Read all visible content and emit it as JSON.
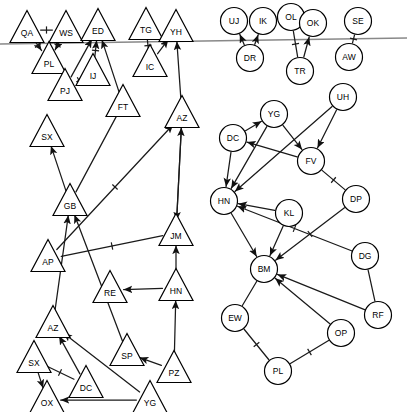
{
  "diagram": {
    "colors": {
      "node_stroke": "#000000",
      "node_fill": "#ffffff",
      "edge": "#1a1a1a",
      "divider": "#888888",
      "background": "#ffffff"
    },
    "divider_line": {
      "name": "horizontal-divider",
      "x1": 0,
      "y1": 44,
      "x2": 407,
      "y2": 38
    },
    "nodes": [
      {
        "id": "QA",
        "label": "QA",
        "shape": "triangle",
        "x": 27,
        "y": 27
      },
      {
        "id": "WS",
        "label": "WS",
        "shape": "triangle",
        "x": 66,
        "y": 27
      },
      {
        "id": "ED",
        "label": "ED",
        "shape": "triangle",
        "x": 98,
        "y": 25
      },
      {
        "id": "TG",
        "label": "TG",
        "shape": "triangle",
        "x": 146,
        "y": 24
      },
      {
        "id": "YH",
        "label": "YH",
        "shape": "triangle",
        "x": 176,
        "y": 26
      },
      {
        "id": "PL1",
        "label": "PL",
        "shape": "triangle",
        "x": 49,
        "y": 58
      },
      {
        "id": "IC",
        "label": "IC",
        "shape": "triangle",
        "x": 150,
        "y": 61
      },
      {
        "id": "IJ",
        "label": "IJ",
        "shape": "triangle",
        "x": 93,
        "y": 70
      },
      {
        "id": "PJ",
        "label": "PJ",
        "shape": "triangle",
        "x": 65,
        "y": 85
      },
      {
        "id": "FT",
        "label": "FT",
        "shape": "triangle",
        "x": 123,
        "y": 101
      },
      {
        "id": "AZ1",
        "label": "AZ",
        "shape": "triangle",
        "x": 182,
        "y": 112
      },
      {
        "id": "SX1",
        "label": "SX",
        "shape": "triangle",
        "x": 47,
        "y": 131
      },
      {
        "id": "GB",
        "label": "GB",
        "shape": "triangle",
        "x": 70,
        "y": 200
      },
      {
        "id": "JM",
        "label": "JM",
        "shape": "triangle",
        "x": 176,
        "y": 230
      },
      {
        "id": "AP",
        "label": "AP",
        "shape": "triangle",
        "x": 48,
        "y": 256
      },
      {
        "id": "RE",
        "label": "RE",
        "shape": "triangle",
        "x": 110,
        "y": 287
      },
      {
        "id": "HN1",
        "label": "HN",
        "shape": "triangle",
        "x": 176,
        "y": 285
      },
      {
        "id": "AZ2",
        "label": "AZ",
        "shape": "triangle",
        "x": 53,
        "y": 322
      },
      {
        "id": "SP",
        "label": "SP",
        "shape": "triangle",
        "x": 127,
        "y": 350
      },
      {
        "id": "SX2",
        "label": "SX",
        "shape": "triangle",
        "x": 34,
        "y": 357
      },
      {
        "id": "PZ",
        "label": "PZ",
        "shape": "triangle",
        "x": 174,
        "y": 367
      },
      {
        "id": "DC2",
        "label": "DC",
        "shape": "triangle",
        "x": 86,
        "y": 382
      },
      {
        "id": "OX",
        "label": "OX",
        "shape": "triangle",
        "x": 47,
        "y": 397
      },
      {
        "id": "YG2",
        "label": "YG",
        "shape": "triangle",
        "x": 150,
        "y": 397
      },
      {
        "id": "UJ",
        "label": "UJ",
        "shape": "circle",
        "x": 234,
        "y": 21
      },
      {
        "id": "IK",
        "label": "IK",
        "shape": "circle",
        "x": 263,
        "y": 21
      },
      {
        "id": "OL",
        "label": "OL",
        "shape": "circle",
        "x": 291,
        "y": 17
      },
      {
        "id": "OK",
        "label": "OK",
        "shape": "circle",
        "x": 313,
        "y": 23
      },
      {
        "id": "SE",
        "label": "SE",
        "shape": "circle",
        "x": 358,
        "y": 21
      },
      {
        "id": "DR",
        "label": "DR",
        "shape": "circle",
        "x": 250,
        "y": 58
      },
      {
        "id": "AW",
        "label": "AW",
        "shape": "circle",
        "x": 349,
        "y": 57
      },
      {
        "id": "TR",
        "label": "TR",
        "shape": "circle",
        "x": 300,
        "y": 71
      },
      {
        "id": "UH",
        "label": "UH",
        "shape": "circle",
        "x": 343,
        "y": 97
      },
      {
        "id": "YG1",
        "label": "YG",
        "shape": "circle",
        "x": 274,
        "y": 114
      },
      {
        "id": "DC1",
        "label": "DC",
        "shape": "circle",
        "x": 233,
        "y": 138
      },
      {
        "id": "FV",
        "label": "FV",
        "shape": "circle",
        "x": 311,
        "y": 161
      },
      {
        "id": "HN2",
        "label": "HN",
        "shape": "circle",
        "x": 224,
        "y": 201
      },
      {
        "id": "KL",
        "label": "KL",
        "shape": "circle",
        "x": 289,
        "y": 213
      },
      {
        "id": "DP",
        "label": "DP",
        "shape": "circle",
        "x": 356,
        "y": 199
      },
      {
        "id": "DG",
        "label": "DG",
        "shape": "circle",
        "x": 365,
        "y": 256
      },
      {
        "id": "BM",
        "label": "BM",
        "shape": "circle",
        "x": 264,
        "y": 269
      },
      {
        "id": "EW",
        "label": "EW",
        "shape": "circle",
        "x": 235,
        "y": 318
      },
      {
        "id": "RF",
        "label": "RF",
        "shape": "circle",
        "x": 378,
        "y": 315
      },
      {
        "id": "OP",
        "label": "OP",
        "shape": "circle",
        "x": 341,
        "y": 333
      },
      {
        "id": "PL2",
        "label": "PL",
        "shape": "circle",
        "x": 278,
        "y": 371
      }
    ],
    "edges": [
      {
        "from": "QA",
        "to": "WS",
        "arrow": false,
        "tick": true
      },
      {
        "from": "QA",
        "to": "PL1",
        "arrow": true,
        "tick": true
      },
      {
        "from": "WS",
        "to": "PL1",
        "arrow": true,
        "tick": true
      },
      {
        "from": "PJ",
        "to": "ED",
        "arrow": true,
        "tick": false
      },
      {
        "from": "IJ",
        "to": "ED",
        "arrow": true,
        "tick": true
      },
      {
        "from": "IJ",
        "to": "PJ",
        "arrow": true,
        "tick": true
      },
      {
        "from": "FT",
        "to": "ED",
        "arrow": true,
        "tick": false
      },
      {
        "from": "TG",
        "to": "IC",
        "arrow": false,
        "tick": true
      },
      {
        "from": "IC",
        "to": "YH",
        "arrow": true,
        "tick": false
      },
      {
        "from": "AZ1",
        "to": "YH",
        "arrow": true,
        "tick": false
      },
      {
        "from": "GB",
        "to": "SX1",
        "arrow": true,
        "tick": false
      },
      {
        "from": "GB",
        "to": "FT",
        "arrow": false,
        "tick": false
      },
      {
        "from": "AZ1",
        "to": "JM",
        "arrow": true,
        "tick": false
      },
      {
        "from": "JM",
        "to": "AZ1",
        "arrow": true,
        "tick": false
      },
      {
        "from": "AP",
        "to": "AZ1",
        "arrow": true,
        "tick": true
      },
      {
        "from": "AZ2",
        "to": "GB",
        "arrow": true,
        "tick": false
      },
      {
        "from": "AP",
        "to": "JM",
        "arrow": false,
        "tick": true
      },
      {
        "from": "SP",
        "to": "GB",
        "arrow": true,
        "tick": false
      },
      {
        "from": "HN1",
        "to": "RE",
        "arrow": true,
        "tick": false
      },
      {
        "from": "HN1",
        "to": "JM",
        "arrow": true,
        "tick": false
      },
      {
        "from": "PZ",
        "to": "HN1",
        "arrow": true,
        "tick": false
      },
      {
        "from": "YG2",
        "to": "OX",
        "arrow": true,
        "tick": false
      },
      {
        "from": "YG2",
        "to": "AZ2",
        "arrow": true,
        "tick": false
      },
      {
        "from": "DC2",
        "to": "AZ2",
        "arrow": true,
        "tick": false
      },
      {
        "from": "SX2",
        "to": "OX",
        "arrow": true,
        "tick": false
      },
      {
        "from": "SX2",
        "to": "DC2",
        "arrow": false,
        "tick": true
      },
      {
        "from": "PZ",
        "to": "SP",
        "arrow": true,
        "tick": false
      },
      {
        "from": "DR",
        "to": "UJ",
        "arrow": true,
        "tick": false
      },
      {
        "from": "DR",
        "to": "IK",
        "arrow": true,
        "tick": false
      },
      {
        "from": "OL",
        "to": "TR",
        "arrow": false,
        "tick": true
      },
      {
        "from": "TR",
        "to": "OK",
        "arrow": true,
        "tick": false
      },
      {
        "from": "AW",
        "to": "SE",
        "arrow": false,
        "tick": true
      },
      {
        "from": "DC1",
        "to": "YG1",
        "arrow": true,
        "tick": false
      },
      {
        "from": "DC1",
        "to": "HN2",
        "arrow": true,
        "tick": false
      },
      {
        "from": "YG1",
        "to": "HN2",
        "arrow": true,
        "tick": false
      },
      {
        "from": "YG1",
        "to": "FV",
        "arrow": true,
        "tick": false
      },
      {
        "from": "UH",
        "to": "FV",
        "arrow": true,
        "tick": false
      },
      {
        "from": "UH",
        "to": "HN2",
        "arrow": true,
        "tick": false
      },
      {
        "from": "FV",
        "to": "DC1",
        "arrow": true,
        "tick": false
      },
      {
        "from": "FV",
        "to": "DP",
        "arrow": false,
        "tick": true
      },
      {
        "from": "HN2",
        "to": "BM",
        "arrow": true,
        "tick": false
      },
      {
        "from": "KL",
        "to": "HN2",
        "arrow": true,
        "tick": false
      },
      {
        "from": "KL",
        "to": "BM",
        "arrow": true,
        "tick": false
      },
      {
        "from": "DP",
        "to": "BM",
        "arrow": true,
        "tick": true
      },
      {
        "from": "DG",
        "to": "HN2",
        "arrow": true,
        "tick": true
      },
      {
        "from": "RF",
        "to": "BM",
        "arrow": true,
        "tick": false
      },
      {
        "from": "RF",
        "to": "DG",
        "arrow": false,
        "tick": false
      },
      {
        "from": "OP",
        "to": "BM",
        "arrow": true,
        "tick": false
      },
      {
        "from": "EW",
        "to": "BM",
        "arrow": false,
        "tick": false
      },
      {
        "from": "EW",
        "to": "PL2",
        "arrow": false,
        "tick": true
      },
      {
        "from": "PL2",
        "to": "OP",
        "arrow": false,
        "tick": true
      }
    ]
  }
}
